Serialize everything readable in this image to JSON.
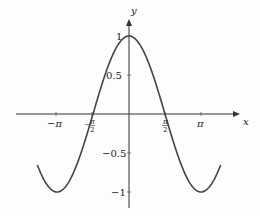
{
  "chart_data": {
    "type": "line",
    "title": "",
    "function": "y = cos(x)",
    "xlabel": "x",
    "ylabel": "y",
    "x_ticks": [
      {
        "value": -3.14159,
        "label": "−π"
      },
      {
        "value": -1.5708,
        "label": "−π/2"
      },
      {
        "value": 1.5708,
        "label": "π/2"
      },
      {
        "value": 3.14159,
        "label": "π"
      }
    ],
    "y_ticks": [
      {
        "value": 1,
        "label": "1"
      },
      {
        "value": 0.5,
        "label": "0.5"
      },
      {
        "value": -0.5,
        "label": "−0.5"
      },
      {
        "value": -1,
        "label": "−1"
      }
    ],
    "xlim": [
      -4.0,
      4.0
    ],
    "ylim": [
      -1.1,
      1.1
    ],
    "grid": false,
    "legend": null,
    "series": [
      {
        "name": "cos x",
        "x_range": [
          -4.0,
          4.0
        ],
        "points": [
          [
            -4.0,
            -0.654
          ],
          [
            -3.1416,
            -1
          ],
          [
            -1.5708,
            0
          ],
          [
            0,
            1
          ],
          [
            1.5708,
            0
          ],
          [
            3.1416,
            -1
          ],
          [
            4.0,
            -0.654
          ]
        ]
      }
    ]
  },
  "labels": {
    "x_axis": "x",
    "y_axis": "y",
    "neg_pi": "−π",
    "pi": "π",
    "pi_sym": "π",
    "two": "2",
    "minus": "−",
    "one": "1",
    "half": "0.5",
    "neg_half": "−0.5",
    "neg_one": "−1"
  }
}
